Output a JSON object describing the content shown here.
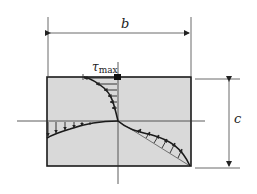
{
  "diagram": {
    "labels": {
      "width": "b",
      "height": "c",
      "tau_symbol": "τ",
      "tau_subscript": "max"
    },
    "colors": {
      "section_fill": "#d9d9d9",
      "stroke": "#1a1a1a",
      "axis": "#333333",
      "dim_line": "#444444"
    },
    "geometry": {
      "rect": {
        "x": 47,
        "y": 77,
        "w": 144,
        "h": 89
      },
      "center": {
        "x": 118,
        "y": 121
      },
      "b_dim_y": 33,
      "c_dim_x": 229
    }
  }
}
